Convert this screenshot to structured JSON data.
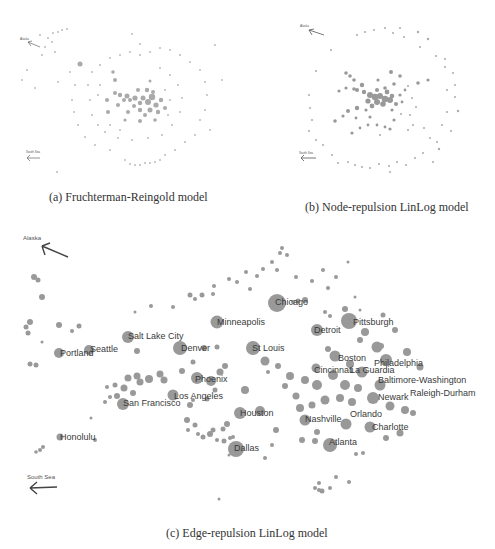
{
  "figure": {
    "panels": [
      {
        "id": "a",
        "caption": "(a) Fruchterman-Reingold model",
        "direction_labels": {
          "top": "Alaska",
          "bottom": "South Sea"
        }
      },
      {
        "id": "b",
        "caption": "(b) Node-repulsion LinLog model",
        "direction_labels": {
          "top": "Alaska",
          "bottom": "South Sea"
        }
      },
      {
        "id": "c",
        "caption": "(c) Edge-repulsion LinLog model",
        "direction_labels": {
          "top": "Alaska",
          "bottom": "South Sea"
        }
      }
    ],
    "node_color": "#999999",
    "arrow_color": "#444444",
    "city_labels": [
      {
        "name": "Chicago",
        "x": 290,
        "y": 302
      },
      {
        "name": "Pittsburgh",
        "x": 372,
        "y": 322
      },
      {
        "name": "Minneapolis",
        "x": 246,
        "y": 322
      },
      {
        "name": "Detroit",
        "x": 327,
        "y": 330
      },
      {
        "name": "Salt Lake City",
        "x": 155,
        "y": 336
      },
      {
        "name": "Portland",
        "x": 76,
        "y": 353
      },
      {
        "name": "Seattle",
        "x": 105,
        "y": 349
      },
      {
        "name": "Denver",
        "x": 195,
        "y": 348
      },
      {
        "name": "St Louis",
        "x": 270,
        "y": 348
      },
      {
        "name": "Boston",
        "x": 352,
        "y": 358
      },
      {
        "name": "Philadelphia",
        "x": 403,
        "y": 363
      },
      {
        "name": "Cincinnati",
        "x": 341,
        "y": 370
      },
      {
        "name": "La Guardia",
        "x": 377,
        "y": 370
      },
      {
        "name": "Baltimore-Washington",
        "x": 420,
        "y": 380
      },
      {
        "name": "Phoenix",
        "x": 210,
        "y": 379
      },
      {
        "name": "Raleigh-Durham",
        "x": 443,
        "y": 393
      },
      {
        "name": "Los Angeles",
        "x": 198,
        "y": 396
      },
      {
        "name": "Newark",
        "x": 395,
        "y": 397
      },
      {
        "name": "San Francisco",
        "x": 152,
        "y": 403
      },
      {
        "name": "Houston",
        "x": 257,
        "y": 413
      },
      {
        "name": "Nashville",
        "x": 323,
        "y": 419
      },
      {
        "name": "Orlando",
        "x": 366,
        "y": 414
      },
      {
        "name": "Charlotte",
        "x": 392,
        "y": 427
      },
      {
        "name": "Honolulu",
        "x": 77,
        "y": 438
      },
      {
        "name": "Atlanta",
        "x": 343,
        "y": 442
      },
      {
        "name": "Dallas",
        "x": 246,
        "y": 448
      }
    ]
  }
}
